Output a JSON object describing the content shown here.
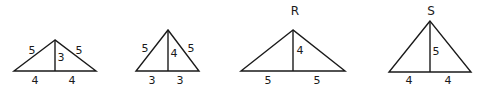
{
  "diagram": {
    "triangles": [
      {
        "id": "t1",
        "name": "",
        "apex": [
          55,
          40
        ],
        "base_left": [
          14,
          71
        ],
        "base_right": [
          96,
          71
        ],
        "foot": [
          55,
          71
        ],
        "labels": {
          "left_side": {
            "text": "5",
            "x": 32,
            "y": 51
          },
          "right_side": {
            "text": "5",
            "x": 79,
            "y": 51
          },
          "altitude": {
            "text": "3",
            "x": 61,
            "y": 58
          },
          "base_left": {
            "text": "4",
            "x": 35,
            "y": 81
          },
          "base_right": {
            "text": "4",
            "x": 72,
            "y": 81
          }
        }
      },
      {
        "id": "t2",
        "name": "",
        "apex": [
          168,
          30
        ],
        "base_left": [
          136,
          71
        ],
        "base_right": [
          199,
          71
        ],
        "foot": [
          168,
          71
        ],
        "labels": {
          "left_side": {
            "text": "5",
            "x": 145,
            "y": 49
          },
          "right_side": {
            "text": "5",
            "x": 191,
            "y": 49
          },
          "altitude": {
            "text": "4",
            "x": 174,
            "y": 54
          },
          "base_left": {
            "text": "3",
            "x": 152,
            "y": 81
          },
          "base_right": {
            "text": "3",
            "x": 180,
            "y": 81
          }
        }
      },
      {
        "id": "t3",
        "name": "R",
        "name_pos": [
          295,
          11
        ],
        "apex": [
          293,
          30
        ],
        "base_left": [
          241,
          71
        ],
        "base_right": [
          345,
          71
        ],
        "foot": [
          293,
          71
        ],
        "labels": {
          "altitude": {
            "text": "4",
            "x": 300,
            "y": 51
          },
          "base_left": {
            "text": "5",
            "x": 268,
            "y": 81
          },
          "base_right": {
            "text": "5",
            "x": 317,
            "y": 81
          }
        }
      },
      {
        "id": "t4",
        "name": "S",
        "name_pos": [
          431,
          11
        ],
        "apex": [
          430,
          21
        ],
        "base_left": [
          389,
          72
        ],
        "base_right": [
          471,
          72
        ],
        "foot": [
          430,
          72
        ],
        "labels": {
          "altitude": {
            "text": "5",
            "x": 436,
            "y": 52
          },
          "base_left": {
            "text": "4",
            "x": 409,
            "y": 81
          },
          "base_right": {
            "text": "4",
            "x": 448,
            "y": 81
          }
        }
      }
    ]
  }
}
